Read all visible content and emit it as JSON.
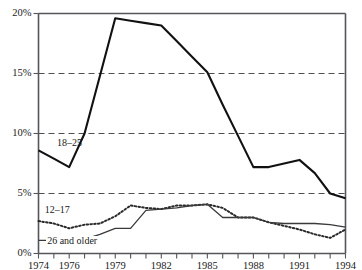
{
  "chart_data": {
    "type": "line",
    "title": "",
    "subtitle": "",
    "xlabel": "",
    "ylabel": "",
    "xlim": [
      1974,
      1994
    ],
    "ylim": [
      0,
      20
    ],
    "grid": "horizontal-dashed",
    "legend_position": "inline-annotations",
    "x": [
      1974,
      1975,
      1976,
      1977,
      1978,
      1979,
      1980,
      1981,
      1982,
      1983,
      1984,
      1985,
      1986,
      1987,
      1988,
      1989,
      1990,
      1991,
      1992,
      1993,
      1994
    ],
    "series": [
      {
        "name": "18–25",
        "style": "solid-thick",
        "values": [
          8.6,
          7.9,
          7.2,
          10.0,
          14.8,
          19.6,
          19.4,
          19.2,
          19.0,
          17.7,
          16.4,
          15.1,
          12.4,
          9.8,
          7.2,
          7.2,
          7.5,
          7.8,
          6.7,
          5.0,
          4.6
        ]
      },
      {
        "name": "12–17",
        "style": "dotted",
        "values": [
          2.7,
          2.5,
          2.1,
          2.4,
          2.5,
          3.1,
          4.0,
          3.8,
          3.7,
          4.0,
          4.0,
          4.1,
          3.8,
          3.0,
          3.0,
          2.6,
          2.3,
          2.0,
          1.6,
          1.3,
          2.0
        ]
      },
      {
        "name": "26 and older",
        "style": "solid-thin",
        "values": [
          1.1,
          1.1,
          1.1,
          1.2,
          1.6,
          2.1,
          2.1,
          3.6,
          3.7,
          3.8,
          4.0,
          4.1,
          3.0,
          3.0,
          3.0,
          2.6,
          2.5,
          2.5,
          2.5,
          2.4,
          2.2
        ]
      }
    ],
    "y_ticks": [
      {
        "value": 0,
        "label": "0%"
      },
      {
        "value": 5,
        "label": "5%"
      },
      {
        "value": 10,
        "label": "10%"
      },
      {
        "value": 15,
        "label": "15%"
      },
      {
        "value": 20,
        "label": "20%"
      }
    ],
    "gridline_values": [
      5,
      10,
      15
    ],
    "x_ticks": [
      1974,
      1975,
      1976,
      1977,
      1978,
      1979,
      1980,
      1981,
      1982,
      1983,
      1984,
      1985,
      1986,
      1987,
      1988,
      1989,
      1990,
      1991,
      1992,
      1993,
      1994
    ],
    "x_tick_labels": [
      {
        "value": 1974,
        "label": "1974"
      },
      {
        "value": 1976,
        "label": "1976"
      },
      {
        "value": 1979,
        "label": "1979"
      },
      {
        "value": 1982,
        "label": "1982"
      },
      {
        "value": 1985,
        "label": "1985"
      },
      {
        "value": 1988,
        "label": "1988"
      },
      {
        "value": 1991,
        "label": "1991"
      },
      {
        "value": 1994,
        "label": "1994"
      }
    ],
    "annotations": [
      {
        "text": "18–25",
        "x": 1975.2,
        "y": 9.1,
        "boxed": false
      },
      {
        "text": "12–17",
        "x": 1974.4,
        "y": 3.55,
        "boxed": false
      },
      {
        "text": "26 and older",
        "x": 1974.5,
        "y": 0.95,
        "boxed": true
      }
    ],
    "colors": {
      "axis": "#55555a",
      "gridline": "#4d4d52",
      "series_18_25": "#111111",
      "series_12_17": "#2a2a2a",
      "series_26_older": "#3a3a3a",
      "background": "#ffffff",
      "text": "#1a1a1a"
    }
  }
}
